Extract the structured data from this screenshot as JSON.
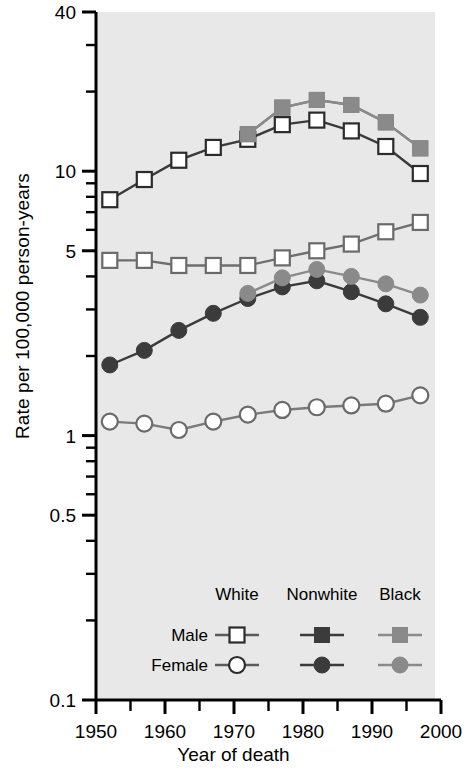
{
  "chart_data": {
    "type": "line",
    "title": "",
    "xlabel": "Year of death",
    "ylabel": "Rate per 100,000 person-years",
    "yscale": "log",
    "ylim": [
      0.1,
      40
    ],
    "xlim": [
      1950,
      2000
    ],
    "ytick_labels": [
      "40",
      "10",
      "5",
      "1",
      "0.5",
      "0.1"
    ],
    "ytick_values": [
      40,
      10,
      5,
      1,
      0.5,
      0.1
    ],
    "yminor_values": [
      30,
      20,
      9,
      8,
      7,
      6,
      4,
      3,
      2,
      0.9,
      0.8,
      0.7,
      0.6,
      0.4,
      0.3,
      0.2
    ],
    "xtick_labels": [
      "1950",
      "1960",
      "1970",
      "1980",
      "1990",
      "2000"
    ],
    "xtick_values": [
      1950,
      1960,
      1970,
      1980,
      1990,
      2000
    ],
    "xminor_values": [
      1955,
      1965,
      1975,
      1985,
      1995
    ],
    "grid": false,
    "legend_position": "inside-bottom",
    "x": [
      1952,
      1957,
      1962,
      1967,
      1972,
      1977,
      1982,
      1987,
      1992,
      1997
    ],
    "series": [
      {
        "name": "White Male",
        "group": "White",
        "sex": "Male",
        "marker": "square",
        "fill": "#ffffff",
        "stroke": "#3a3a3a",
        "x": [
          1952,
          1957,
          1962,
          1967,
          1972,
          1977,
          1982,
          1987,
          1992,
          1997
        ],
        "values": [
          7.8,
          9.3,
          11.0,
          12.3,
          13.2,
          15.0,
          15.6,
          14.2,
          12.4,
          9.8
        ]
      },
      {
        "name": "Nonwhite Male",
        "group": "Nonwhite",
        "sex": "Male",
        "marker": "square",
        "fill": "#565656",
        "stroke": "#6e6e6e",
        "x": [
          1972,
          1977,
          1982,
          1987,
          1992,
          1997
        ],
        "values": [
          13.8,
          17.4,
          18.6,
          17.8,
          15.3,
          12.2
        ]
      },
      {
        "name": "Black Male",
        "group": "Black",
        "sex": "Male",
        "marker": "square",
        "fill": "#8a8a8a",
        "stroke": "#8a8a8a",
        "x": [
          1972,
          1977,
          1982,
          1987,
          1992,
          1997
        ],
        "values": [
          13.8,
          17.4,
          18.6,
          17.8,
          15.3,
          12.2
        ]
      },
      {
        "name": "White Female",
        "group": "White",
        "sex": "Female",
        "marker": "square",
        "fill": "#ffffff",
        "stroke": "#6e6e6e",
        "x": [
          1952,
          1957,
          1962,
          1967,
          1972,
          1977,
          1982,
          1987,
          1992,
          1997
        ],
        "values": [
          4.6,
          4.6,
          4.4,
          4.4,
          4.4,
          4.7,
          5.0,
          5.3,
          5.9,
          6.4
        ]
      },
      {
        "name": "Nonwhite Female",
        "group": "Nonwhite",
        "sex": "Female",
        "marker": "circle",
        "fill": "#3b3b3b",
        "stroke": "#3b3b3b",
        "x": [
          1952,
          1957,
          1962,
          1967,
          1972,
          1977,
          1982,
          1987,
          1992,
          1997
        ],
        "values": [
          1.85,
          2.1,
          2.5,
          2.9,
          3.3,
          3.65,
          3.85,
          3.5,
          3.15,
          2.8
        ]
      },
      {
        "name": "Black Female",
        "group": "Black",
        "sex": "Female",
        "marker": "circle",
        "fill": "#8a8a8a",
        "stroke": "#8a8a8a",
        "x": [
          1972,
          1977,
          1982,
          1987,
          1992,
          1997
        ],
        "values": [
          3.45,
          3.95,
          4.25,
          4.0,
          3.75,
          3.4
        ]
      },
      {
        "name": "White Female (low)",
        "group": "White",
        "sex": "Female",
        "marker": "circle",
        "fill": "#ffffff",
        "stroke": "#7a7a7a",
        "x": [
          1952,
          1957,
          1962,
          1967,
          1972,
          1977,
          1982,
          1987,
          1992,
          1997
        ],
        "values": [
          1.13,
          1.11,
          1.05,
          1.13,
          1.2,
          1.25,
          1.28,
          1.3,
          1.32,
          1.42
        ]
      }
    ]
  },
  "legend": {
    "headers": [
      "White",
      "Nonwhite",
      "Black"
    ],
    "rows": [
      {
        "label": "Male",
        "marker": "square"
      },
      {
        "label": "Female",
        "marker": "circle"
      }
    ]
  },
  "axes": {
    "y_title": "Rate per 100,000 person-years",
    "x_title": "Year of death"
  },
  "colors": {
    "plot_background": "#e8e8e8",
    "axis": "#000000",
    "white_marker_fill": "#ffffff",
    "nonwhite_marker_fill": "#3b3b3b",
    "black_marker_fill": "#8a8a8a",
    "line_dark": "#3a3a3a",
    "line_gray": "#7a7a7a"
  }
}
